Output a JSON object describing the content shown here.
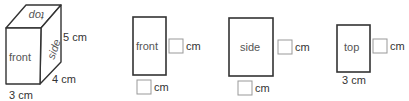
{
  "cuboid": {
    "faces": {
      "top": "top",
      "front": "front",
      "side": "side"
    },
    "dimensions": {
      "height": "5 cm",
      "depth": "4 cm",
      "width": "3 cm"
    }
  },
  "views": [
    {
      "name": "front",
      "label": "front",
      "right_unit": "cm",
      "bottom_unit": "cm",
      "right_value": "",
      "bottom_value": ""
    },
    {
      "name": "side",
      "label": "side",
      "right_unit": "cm",
      "bottom_unit": "cm",
      "right_value": "",
      "bottom_value": ""
    },
    {
      "name": "top",
      "label": "top",
      "right_unit": "cm",
      "bottom_label": "3 cm",
      "right_value": ""
    }
  ]
}
